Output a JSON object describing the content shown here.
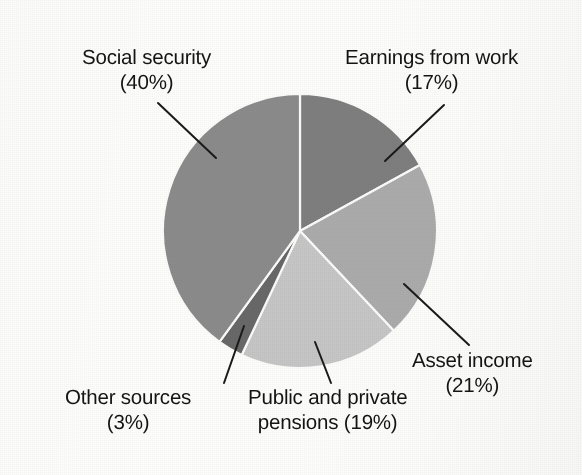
{
  "figure": {
    "background_color": "#fdfdfc",
    "text_color": "#141414",
    "leader_line_color": "#1a1a1a"
  },
  "chart_data": {
    "type": "pie",
    "title": "",
    "subtitle": "",
    "xlabel": "",
    "ylabel": "",
    "legend_position": "none",
    "grid": false,
    "label_format": "{name} ({value}%)",
    "units": "percent",
    "total": 100,
    "start_angle_deg": 0,
    "direction": "clockwise",
    "center": {
      "x": 300,
      "y": 231
    },
    "radius": 137,
    "categories": [
      "Earnings from work",
      "Asset income",
      "Public and private pensions",
      "Other sources",
      "Social security"
    ],
    "values": [
      17,
      21,
      19,
      3,
      40
    ],
    "colors": [
      "#7e7e7e",
      "#ababab",
      "#c6c6c6",
      "#686868",
      "#8b8b8b"
    ],
    "slices": [
      {
        "name": "Earnings from work",
        "value": 17,
        "label_line_1": "Earnings from work",
        "label_line_2": "(17%)",
        "color": "#7e7e7e",
        "start_angle_deg": 0,
        "end_angle_deg": 61.2
      },
      {
        "name": "Asset income",
        "value": 21,
        "label_line_1": "Asset income",
        "label_line_2": "(21%)",
        "color": "#ababab",
        "start_angle_deg": 61.2,
        "end_angle_deg": 136.8
      },
      {
        "name": "Public and private pensions",
        "value": 19,
        "label_line_1": "Public and private",
        "label_line_2": "pensions (19%)",
        "color": "#c6c6c6",
        "start_angle_deg": 136.8,
        "end_angle_deg": 205.2
      },
      {
        "name": "Other sources",
        "value": 3,
        "label_line_1": "Other sources",
        "label_line_2": "(3%)",
        "color": "#686868",
        "start_angle_deg": 205.2,
        "end_angle_deg": 216.0
      },
      {
        "name": "Social security",
        "value": 40,
        "label_line_1": "Social security",
        "label_line_2": "(40%)",
        "color": "#8b8b8b",
        "start_angle_deg": 216.0,
        "end_angle_deg": 360.0
      }
    ],
    "leader_lines": [
      {
        "name": "social-security-leader",
        "x1": 158,
        "y1": 103,
        "x2": 216,
        "y2": 158
      },
      {
        "name": "earnings-work-leader",
        "x1": 444,
        "y1": 105,
        "x2": 385,
        "y2": 161
      },
      {
        "name": "asset-income-leader",
        "x1": 469,
        "y1": 345,
        "x2": 404,
        "y2": 284
      },
      {
        "name": "pensions-leader",
        "x1": 331,
        "y1": 383,
        "x2": 315,
        "y2": 342
      },
      {
        "name": "other-sources-leader",
        "x1": 224,
        "y1": 383,
        "x2": 244,
        "y2": 326
      }
    ]
  }
}
